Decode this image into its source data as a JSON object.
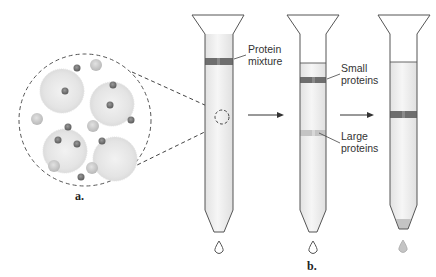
{
  "diagram": {
    "panels": [
      {
        "id": "a",
        "label": "a.",
        "description": "Magnified view of porous beads with small and large proteins"
      },
      {
        "id": "b",
        "label": "b.",
        "description": "Column sequence separating small and large proteins"
      }
    ],
    "labels": {
      "protein_mixture": [
        "Protein",
        "mixture"
      ],
      "small_proteins": [
        "Small",
        "proteins"
      ],
      "large_proteins": [
        "Large",
        "proteins"
      ]
    },
    "columns": [
      {
        "name": "column-1",
        "bands": [
          {
            "label": "Protein mixture",
            "color": "#6e6e6e"
          }
        ]
      },
      {
        "name": "column-2",
        "bands": [
          {
            "label": "Small proteins",
            "color": "#6e6e6e"
          },
          {
            "label": "Large proteins",
            "color": "#c4c4c4"
          }
        ]
      },
      {
        "name": "column-3",
        "bands": [
          {
            "label": "Small proteins",
            "color": "#6e6e6e"
          }
        ],
        "eluate": "Large proteins"
      }
    ],
    "colors": {
      "outline": "#555555",
      "column_fill": "#eeeeee",
      "dark_band": "#6e6e6e",
      "light_band": "#c4c4c4",
      "bead": "#e6e6e6",
      "small_protein": "#7a7a7a",
      "large_protein": "#c8c8c8"
    }
  }
}
